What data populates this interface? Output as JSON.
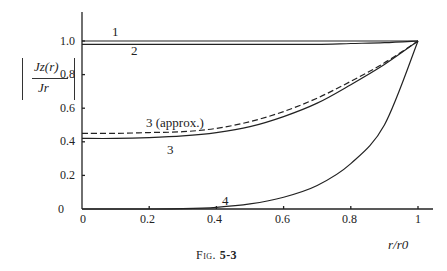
{
  "chart_data": {
    "type": "line",
    "title": "",
    "caption": "Fig. 5-3",
    "xlabel": "r/r0",
    "ylabel": "|Jz(r)/Jr|",
    "xlim": [
      0,
      1.0
    ],
    "ylim": [
      0,
      1.15
    ],
    "x_ticks": [
      "0",
      "0.2",
      "0.4",
      "0.6",
      "0.8",
      "1"
    ],
    "y_ticks": [
      "0",
      "0.2",
      "0.4",
      "0.6",
      "0.8",
      "1.0"
    ],
    "grid": false,
    "legend": "none (curves labeled inline)",
    "x": [
      0,
      0.1,
      0.2,
      0.3,
      0.4,
      0.5,
      0.6,
      0.7,
      0.8,
      0.9,
      1.0
    ],
    "series": [
      {
        "name": "1",
        "style": "solid",
        "values": [
          1.0,
          1.0,
          1.0,
          1.0,
          1.0,
          1.0,
          1.0,
          1.0,
          1.0,
          1.0,
          1.0
        ]
      },
      {
        "name": "2",
        "style": "solid",
        "values": [
          0.98,
          0.98,
          0.98,
          0.98,
          0.98,
          0.98,
          0.98,
          0.98,
          0.985,
          0.99,
          1.0
        ]
      },
      {
        "name": "3 (approx.)",
        "style": "dashed",
        "values": [
          0.45,
          0.45,
          0.455,
          0.46,
          0.48,
          0.52,
          0.58,
          0.66,
          0.76,
          0.87,
          1.0
        ]
      },
      {
        "name": "3",
        "style": "solid",
        "values": [
          0.42,
          0.42,
          0.425,
          0.435,
          0.455,
          0.49,
          0.55,
          0.63,
          0.74,
          0.86,
          1.0
        ]
      },
      {
        "name": "4",
        "style": "solid",
        "values": [
          0.0,
          0.0,
          0.0,
          0.002,
          0.01,
          0.03,
          0.07,
          0.14,
          0.27,
          0.5,
          1.0
        ]
      }
    ]
  },
  "labels": {
    "curve1": "1",
    "curve2": "2",
    "curve3_approx": "3 (approx.)",
    "curve3": "3",
    "curve4": "4",
    "ylabel_num": "Jz(r)",
    "ylabel_den": "Jr",
    "xlabel": "r/r0",
    "caption_prefix": "Fig.",
    "caption_number": "5-3"
  },
  "ticks": {
    "x": [
      "0",
      "0.2",
      "0.4",
      "0.6",
      "0.8",
      "1"
    ],
    "y": [
      "0",
      "0.2",
      "0.4",
      "0.6",
      "0.8",
      "1.0"
    ]
  }
}
